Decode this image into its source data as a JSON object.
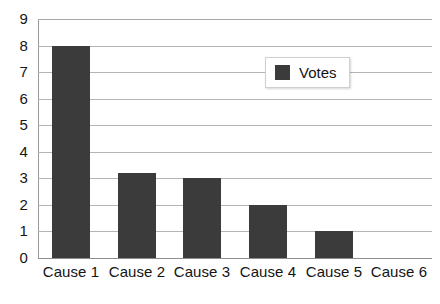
{
  "chart_data": {
    "type": "bar",
    "title": "",
    "xlabel": "",
    "ylabel": "",
    "categories": [
      "Cause 1",
      "Cause 2",
      "Cause 3",
      "Cause 4",
      "Cause 5",
      "Cause 6"
    ],
    "values": [
      8,
      3.2,
      3,
      2,
      1,
      0
    ],
    "series": [
      {
        "name": "Votes",
        "values": [
          8,
          3.2,
          3,
          2,
          1,
          0
        ]
      }
    ],
    "ylim": [
      0,
      9
    ],
    "ytick_labels": [
      "9",
      "8",
      "7",
      "6",
      "5",
      "4",
      "3",
      "2",
      "1",
      "0"
    ],
    "ytick_values": [
      9,
      8,
      7,
      6,
      5,
      4,
      3,
      2,
      1,
      0
    ],
    "grid": true,
    "grid_axis": "y",
    "legend_position": "top-right",
    "bar_color": "#3b3b3b",
    "gridline_color": "#b4b4b4",
    "background_color": "#ffffff"
  },
  "legend": {
    "entries": [
      {
        "label": "Votes",
        "color": "#3b3b3b"
      }
    ]
  },
  "caption": {
    "sliver_text": ""
  }
}
